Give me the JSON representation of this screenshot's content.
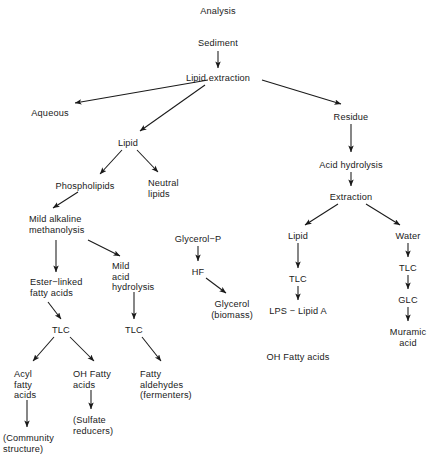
{
  "diagram": {
    "title": "Analysis",
    "ink_color": "#1a1a1a",
    "background_color": "#ffffff",
    "nodes": [
      {
        "id": "analysis",
        "label": "Analysis",
        "x": 218,
        "y": 6,
        "align": "c"
      },
      {
        "id": "sediment",
        "label": "Sediment",
        "x": 218,
        "y": 38,
        "align": "c"
      },
      {
        "id": "lipid-extraction",
        "label": "Lipid extraction",
        "x": 218,
        "y": 73,
        "align": "c"
      },
      {
        "id": "aqueous",
        "label": "Aqueous",
        "x": 50,
        "y": 108,
        "align": "c"
      },
      {
        "id": "lipid-1",
        "label": "Lipid",
        "x": 128,
        "y": 138,
        "align": "c"
      },
      {
        "id": "residue",
        "label": "Residue",
        "x": 351,
        "y": 112,
        "align": "c"
      },
      {
        "id": "acid-hydrolysis",
        "label": "Acid hydrolysis",
        "x": 351,
        "y": 160,
        "align": "c"
      },
      {
        "id": "extraction",
        "label": "Extraction",
        "x": 351,
        "y": 192,
        "align": "c"
      },
      {
        "id": "phospholipids",
        "label": "Phospholipids",
        "x": 85,
        "y": 181,
        "align": "c"
      },
      {
        "id": "neutral-lipids",
        "label": "Neutral\nlipids",
        "x": 148,
        "y": 178,
        "align": "l"
      },
      {
        "id": "mild-alkaline",
        "label": "Mild alkaline\nmethanolysis",
        "x": 29,
        "y": 214,
        "align": "l"
      },
      {
        "id": "mild-acid",
        "label": "Mild\nacid\nhydrolysis",
        "x": 112,
        "y": 261,
        "align": "l"
      },
      {
        "id": "ester-linked",
        "label": "Ester−linked\nfatty acids",
        "x": 30,
        "y": 277,
        "align": "l"
      },
      {
        "id": "tlc-left",
        "label": "TLC",
        "x": 61,
        "y": 325,
        "align": "c"
      },
      {
        "id": "tlc-mid",
        "label": "TLC",
        "x": 134,
        "y": 325,
        "align": "c"
      },
      {
        "id": "acyl-fatty-acids",
        "label": "Acyl\nfatty\nacids",
        "x": 14,
        "y": 369,
        "align": "l"
      },
      {
        "id": "oh-fatty-acids-1",
        "label": "OH Fatty\nacids",
        "x": 73,
        "y": 369,
        "align": "l"
      },
      {
        "id": "fatty-aldehydes",
        "label": "Fatty\naldehydes\n(fermenters)",
        "x": 140,
        "y": 369,
        "align": "l"
      },
      {
        "id": "community-structure",
        "label": "(Community\nstructure)",
        "x": 3,
        "y": 433,
        "align": "l"
      },
      {
        "id": "sulfate-reducers",
        "label": "(Sulfate\nreducers)",
        "x": 73,
        "y": 415,
        "align": "l"
      },
      {
        "id": "glycerol-p",
        "label": "Glycerol−P",
        "x": 198,
        "y": 234,
        "align": "c"
      },
      {
        "id": "hf",
        "label": "HF",
        "x": 198,
        "y": 267,
        "align": "c"
      },
      {
        "id": "glycerol-biomass",
        "label": "Glycerol\n(biomass)",
        "x": 232,
        "y": 299,
        "align": "c"
      },
      {
        "id": "lipid-2",
        "label": "Lipid",
        "x": 298,
        "y": 231,
        "align": "c"
      },
      {
        "id": "tlc-right-a",
        "label": "TLC",
        "x": 298,
        "y": 274,
        "align": "c"
      },
      {
        "id": "lps-lipid-a",
        "label": "LPS − Lipid A",
        "x": 298,
        "y": 306,
        "align": "c"
      },
      {
        "id": "oh-fatty-acids-2",
        "label": "OH Fatty acids",
        "x": 298,
        "y": 352,
        "align": "c"
      },
      {
        "id": "water",
        "label": "Water",
        "x": 408,
        "y": 231,
        "align": "c"
      },
      {
        "id": "tlc-right-b",
        "label": "TLC",
        "x": 408,
        "y": 263,
        "align": "c"
      },
      {
        "id": "glc",
        "label": "GLC",
        "x": 408,
        "y": 295,
        "align": "c"
      },
      {
        "id": "muramic-acid",
        "label": "Muramic\nacid",
        "x": 408,
        "y": 327,
        "align": "c"
      }
    ],
    "arrows": [
      {
        "id": "sediment-to-lipid-extraction",
        "x1": 218,
        "y1": 51,
        "x2": 218,
        "y2": 68
      },
      {
        "id": "lipid-extraction-to-aqueous",
        "x1": 208,
        "y1": 80,
        "x2": 75,
        "y2": 103
      },
      {
        "id": "lipid-extraction-to-lipid",
        "x1": 205,
        "y1": 85,
        "x2": 140,
        "y2": 131
      },
      {
        "id": "lipid-extraction-to-residue",
        "x1": 262,
        "y1": 80,
        "x2": 341,
        "y2": 104
      },
      {
        "id": "residue-to-acid-hydrolysis",
        "x1": 351,
        "y1": 124,
        "x2": 351,
        "y2": 152
      },
      {
        "id": "acid-hydrolysis-to-extraction",
        "x1": 351,
        "y1": 172,
        "x2": 351,
        "y2": 186
      },
      {
        "id": "lipid-to-phospholipids",
        "x1": 122,
        "y1": 150,
        "x2": 100,
        "y2": 174
      },
      {
        "id": "lipid-to-neutral-lipids",
        "x1": 137,
        "y1": 150,
        "x2": 158,
        "y2": 172
      },
      {
        "id": "phospholipids-to-mild-alkaline",
        "x1": 78,
        "y1": 192,
        "x2": 53,
        "y2": 208
      },
      {
        "id": "mild-alkaline-to-ester-linked",
        "x1": 56,
        "y1": 240,
        "x2": 56,
        "y2": 272
      },
      {
        "id": "mild-alkaline-to-mild-acid",
        "x1": 88,
        "y1": 240,
        "x2": 120,
        "y2": 256
      },
      {
        "id": "ester-linked-to-tlc-left",
        "x1": 48,
        "y1": 302,
        "x2": 61,
        "y2": 319
      },
      {
        "id": "mild-acid-to-tlc-mid",
        "x1": 134,
        "y1": 292,
        "x2": 134,
        "y2": 319
      },
      {
        "id": "tlc-left-to-acyl",
        "x1": 54,
        "y1": 337,
        "x2": 33,
        "y2": 361
      },
      {
        "id": "tlc-left-to-oh-fatty",
        "x1": 70,
        "y1": 337,
        "x2": 94,
        "y2": 361
      },
      {
        "id": "tlc-mid-to-fatty-aldehydes",
        "x1": 142,
        "y1": 337,
        "x2": 161,
        "y2": 361
      },
      {
        "id": "acyl-to-community",
        "x1": 27,
        "y1": 400,
        "x2": 27,
        "y2": 427
      },
      {
        "id": "oh-fatty-to-sulfate",
        "x1": 91,
        "y1": 390,
        "x2": 91,
        "y2": 409
      },
      {
        "id": "glycerol-p-to-hf",
        "x1": 198,
        "y1": 246,
        "x2": 198,
        "y2": 261
      },
      {
        "id": "hf-to-glycerol",
        "x1": 206,
        "y1": 278,
        "x2": 226,
        "y2": 293
      },
      {
        "id": "extraction-to-lipid",
        "x1": 338,
        "y1": 204,
        "x2": 305,
        "y2": 225
      },
      {
        "id": "extraction-to-water",
        "x1": 366,
        "y1": 204,
        "x2": 400,
        "y2": 225
      },
      {
        "id": "lipid2-to-tlc",
        "x1": 298,
        "y1": 243,
        "x2": 298,
        "y2": 268
      },
      {
        "id": "tlc-to-lps-lipid-a",
        "x1": 298,
        "y1": 286,
        "x2": 298,
        "y2": 300
      },
      {
        "id": "water-to-tlc",
        "x1": 408,
        "y1": 243,
        "x2": 408,
        "y2": 257
      },
      {
        "id": "tlc-to-glc",
        "x1": 408,
        "y1": 275,
        "x2": 408,
        "y2": 289
      },
      {
        "id": "glc-to-muramic-acid",
        "x1": 408,
        "y1": 307,
        "x2": 408,
        "y2": 321
      }
    ]
  }
}
